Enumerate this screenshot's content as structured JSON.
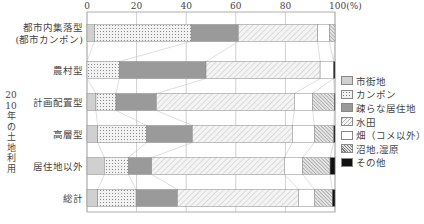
{
  "chart_data": {
    "type": "bar",
    "orientation": "horizontal",
    "stacked": true,
    "title": "",
    "ylabel": "2010年の土地利用",
    "xlabel": "",
    "x_unit": "(%)",
    "xlim": [
      0,
      100
    ],
    "x_ticks": [
      "0",
      "20",
      "40",
      "60",
      "80",
      "100"
    ],
    "categories": [
      "都市内集落型\n(都市カンポン)",
      "農村型",
      "計画配置型",
      "高層型",
      "居住地以外",
      "総計"
    ],
    "series": [
      {
        "name": "市街地",
        "values": [
          3,
          0,
          3.6,
          4.3,
          7,
          4.3
        ]
      },
      {
        "name": "カンポン",
        "values": [
          39,
          13,
          8.1,
          19.7,
          9.7,
          15.5
        ]
      },
      {
        "name": "疎らな居住地",
        "values": [
          19,
          35,
          16.3,
          18.5,
          9.4,
          16.7
        ]
      },
      {
        "name": "水田",
        "values": [
          32,
          46,
          55.6,
          40.3,
          53.5,
          48.8
        ]
      },
      {
        "name": "畑（コメ以外）",
        "values": [
          4.7,
          5.4,
          7.4,
          8.9,
          7.4,
          6.4
        ]
      },
      {
        "name": "沼地,湿原",
        "values": [
          2.3,
          0,
          8.7,
          7.8,
          11,
          7.2
        ]
      },
      {
        "name": "その他",
        "values": [
          0,
          0.6,
          0.3,
          0.5,
          2,
          1.1
        ]
      }
    ],
    "grid": true,
    "legend_position": "right"
  },
  "legend": {
    "items": [
      {
        "label": "市街地",
        "fill": "#d0d0d0",
        "pattern": "solid"
      },
      {
        "label": "カンポン",
        "fill": "#f2f2f2",
        "pattern": "dots"
      },
      {
        "label": "疎らな居住地",
        "fill": "#9a9a9a",
        "pattern": "solid"
      },
      {
        "label": "水田",
        "fill": "#f4f4f4",
        "pattern": "hatch-light"
      },
      {
        "label": "畑（コメ以外）",
        "fill": "#ffffff",
        "pattern": "solid"
      },
      {
        "label": "沼地,湿原",
        "fill": "#e6e6e6",
        "pattern": "hatch-dense"
      },
      {
        "label": "その他",
        "fill": "#111111",
        "pattern": "solid"
      }
    ]
  },
  "axis": {
    "unit_label": "(%)",
    "vertical_label": "2010年の土地利用"
  }
}
